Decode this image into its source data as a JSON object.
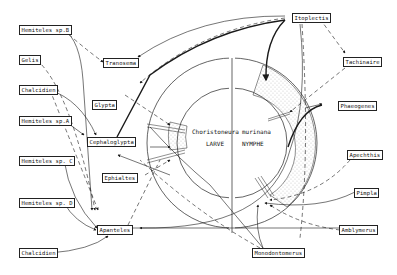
{
  "diagram": {
    "center": {
      "species_left": "Choristoneura",
      "species_right": "murinana",
      "stage_left": "LARVE",
      "stage_right": "NYMPHE"
    },
    "nodes": [
      {
        "id": "hemiteles_b",
        "label": "Hemiteles sp.B"
      },
      {
        "id": "gelis",
        "label": "Gelis"
      },
      {
        "id": "chalcidien_1",
        "label": "Chalcidien"
      },
      {
        "id": "hemiteles_a",
        "label": "Hemiteles sp.A"
      },
      {
        "id": "hemiteles_c",
        "label": "Hemiteles sp. C"
      },
      {
        "id": "hemiteles_d",
        "label": "Hemiteles sp. D"
      },
      {
        "id": "chalcidien_2",
        "label": "Chalcidien"
      },
      {
        "id": "tranosema",
        "label": "Tranosema"
      },
      {
        "id": "glypta",
        "label": "Glypta"
      },
      {
        "id": "cephaloglypta",
        "label": "Cephaloglypta"
      },
      {
        "id": "ephialtes",
        "label": "Ephialtes"
      },
      {
        "id": "apanteles",
        "label": "Apanteles"
      },
      {
        "id": "itoplectis",
        "label": "Itoplectis"
      },
      {
        "id": "tachinaire",
        "label": "Tachinaire"
      },
      {
        "id": "phaeogenes",
        "label": "Phaeogenes"
      },
      {
        "id": "apechthis",
        "label": "Apechthis"
      },
      {
        "id": "pimpla",
        "label": "Pimpla"
      },
      {
        "id": "amblymerus",
        "label": "Amblymerus"
      },
      {
        "id": "monodontomerus",
        "label": "Monodontomerus"
      }
    ],
    "colors": {
      "ink": "#1a1a1a",
      "paper": "#ffffff"
    }
  }
}
